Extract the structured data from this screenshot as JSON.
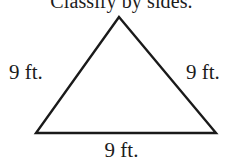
{
  "figure": {
    "prompt": "Classify by sides.",
    "background_color": "#ffffff",
    "stroke_color": "#1a1a1a"
  },
  "shape": {
    "name": "triangle",
    "vertices": {
      "apex": {
        "x": 119,
        "y": 17
      },
      "bottom_left": {
        "x": 36,
        "y": 133
      },
      "bottom_right": {
        "x": 216,
        "y": 133
      }
    }
  },
  "labels": {
    "left_side": "9 ft.",
    "right_side": "9 ft.",
    "bottom_side": "9 ft."
  }
}
